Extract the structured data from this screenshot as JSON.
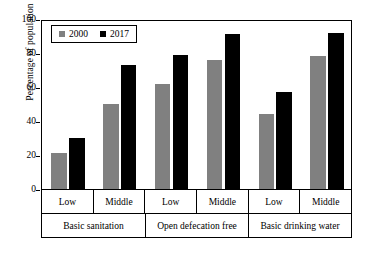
{
  "chart_data": {
    "type": "bar",
    "title": "",
    "xlabel": "",
    "ylabel": "Percentage of population",
    "ylim": [
      0,
      100
    ],
    "yticks": [
      0,
      20,
      40,
      60,
      80,
      100
    ],
    "grid": false,
    "legend_position": "top-left",
    "legend": [
      "2000",
      "2017"
    ],
    "group_labels": [
      "Basic sanitation",
      "Open defecation free",
      "Basic drinking water"
    ],
    "subgroup_labels": [
      "Low",
      "Middle"
    ],
    "categories": [
      "Basic sanitation - Low",
      "Basic sanitation - Middle",
      "Open defecation free - Low",
      "Open defecation free - Middle",
      "Basic drinking water - Low",
      "Basic drinking water - Middle"
    ],
    "series": [
      {
        "name": "2000",
        "color": "#808080",
        "values": [
          21,
          50,
          62,
          76,
          44,
          78
        ]
      },
      {
        "name": "2017",
        "color": "#000000",
        "values": [
          30,
          73,
          79,
          91,
          57,
          92
        ]
      }
    ]
  },
  "axis": {
    "tick_0": "0",
    "tick_20": "20",
    "tick_40": "40",
    "tick_60": "60",
    "tick_80": "80",
    "tick_100": "100"
  },
  "groups": [
    {
      "label": "Basic sanitation",
      "subgroups": [
        {
          "label": "Low",
          "v2000": 21,
          "v2017": 30
        },
        {
          "label": "Middle",
          "v2000": 50,
          "v2017": 73
        }
      ]
    },
    {
      "label": "Open defecation free",
      "subgroups": [
        {
          "label": "Low",
          "v2000": 62,
          "v2017": 79
        },
        {
          "label": "Middle",
          "v2000": 76,
          "v2017": 91
        }
      ]
    },
    {
      "label": "Basic drinking water",
      "subgroups": [
        {
          "label": "Low",
          "v2000": 44,
          "v2017": 57
        },
        {
          "label": "Middle",
          "v2000": 78,
          "v2017": 92
        }
      ]
    }
  ]
}
